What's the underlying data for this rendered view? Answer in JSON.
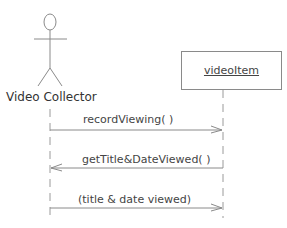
{
  "diagram": {
    "type": "sequence-diagram",
    "actor": {
      "label": "Video Collector"
    },
    "object": {
      "label": "videoItem"
    },
    "messages": [
      {
        "label": "recordViewing( )",
        "from": "Video Collector",
        "to": "videoItem",
        "direction": "right"
      },
      {
        "label": "getTitle&DateViewed( )",
        "from": "videoItem",
        "to": "Video Collector",
        "direction": "left"
      },
      {
        "label": "(title & date viewed)",
        "from": "Video Collector",
        "to": "videoItem",
        "direction": "right"
      }
    ]
  },
  "colors": {
    "line": "#8a8a8a",
    "text": "#444444",
    "background": "#ffffff"
  }
}
